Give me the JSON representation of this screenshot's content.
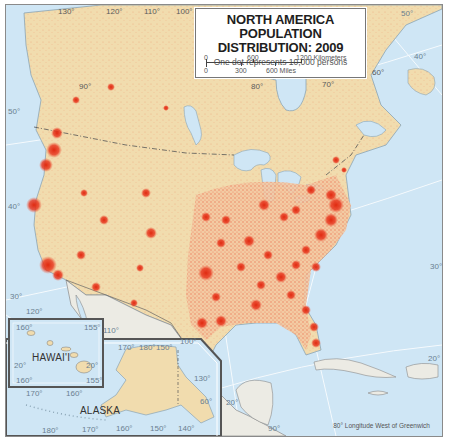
{
  "title": {
    "line1": "NORTH AMERICA",
    "line2": "POPULATION DISTRIBUTION: 2009",
    "subtitle": "One dot represents 10,000 persons"
  },
  "scale_bar": {
    "km_labels": [
      "0",
      "600",
      "1200 Kilometers"
    ],
    "mi_labels": [
      "0",
      "300",
      "600 Miles"
    ]
  },
  "graticule": {
    "top_longitudes": [
      "130°",
      "120°",
      "110°",
      "100°"
    ],
    "inner_longitudes": [
      "90°",
      "80°",
      "70°",
      "60°"
    ],
    "latitudes_left": [
      "50°",
      "40°",
      "30°"
    ],
    "latitudes_right": [
      "50°",
      "40°",
      "30°",
      "20°"
    ],
    "bottom_lon": "120°",
    "misc": [
      "110°",
      "100°",
      "20°",
      "90°"
    ]
  },
  "insets": {
    "hawaii": {
      "name": "HAWAI'I",
      "labels": [
        "160°",
        "155°",
        "20°",
        "20°",
        "160°",
        "155°"
      ]
    },
    "alaska": {
      "name": "ALASKA",
      "labels": [
        "170°",
        "180°",
        "150°",
        "170°",
        "160°",
        "130°",
        "60°",
        "180°",
        "170°",
        "160°",
        "150°",
        "140°"
      ]
    }
  },
  "footer": {
    "note": "80° Longitude West of Greenwich"
  },
  "colors": {
    "ocean": "#cfe6f5",
    "land_us_canada": "#f1dcae",
    "land_other": "#ecebe4",
    "population_dot": "#e8341c",
    "border": "#555555"
  }
}
